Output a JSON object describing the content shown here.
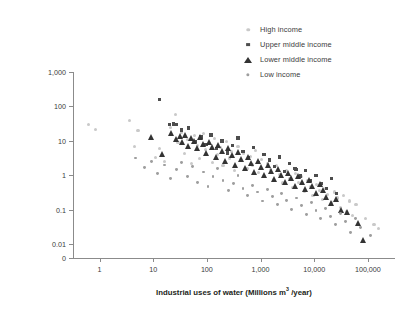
{
  "chart_data": {
    "type": "scatter",
    "title": "",
    "xlabel": "Industrial uses of water (Millions m³ /year)",
    "ylabel_line1": "Per capita industrial water use efficiency",
    "ylabel_line2": "(US$/m³)",
    "xscale": "log",
    "yscale": "log",
    "xlim": [
      0.32,
      320000
    ],
    "ylim": [
      0.004,
      1000
    ],
    "grid": false,
    "legend_position": "top-right",
    "xticks": [
      "1",
      "10",
      "100",
      "1,000",
      "10,000",
      "100,000"
    ],
    "xtick_values": [
      1,
      10,
      100,
      1000,
      10000,
      100000
    ],
    "yticks": [
      "1,000",
      "100",
      "10",
      "1",
      "0.1",
      "0.01",
      "0"
    ],
    "ytick_values": [
      1000,
      100,
      10,
      1,
      0.1,
      0.01,
      0
    ],
    "series": [
      {
        "name": "High income",
        "marker": "circle",
        "color": "#c9c9c9",
        "size": 3.1,
        "points": [
          [
            0.62,
            30
          ],
          [
            0.85,
            22
          ],
          [
            3.6,
            40
          ],
          [
            4.4,
            7.0
          ],
          [
            5.2,
            20
          ],
          [
            9.0,
            12
          ],
          [
            11,
            3.4
          ],
          [
            13,
            6.0
          ],
          [
            16,
            2.6
          ],
          [
            21,
            25
          ],
          [
            26,
            60
          ],
          [
            29,
            9.0
          ],
          [
            33,
            18
          ],
          [
            38,
            4.2
          ],
          [
            44,
            11
          ],
          [
            52,
            2.2
          ],
          [
            58,
            14
          ],
          [
            66,
            7.5
          ],
          [
            74,
            3.0
          ],
          [
            86,
            16
          ],
          [
            95,
            5.5
          ],
          [
            110,
            8.5
          ],
          [
            125,
            2.4
          ],
          [
            140,
            12
          ],
          [
            160,
            4.0
          ],
          [
            180,
            6.5
          ],
          [
            200,
            1.9
          ],
          [
            230,
            9.5
          ],
          [
            260,
            3.2
          ],
          [
            290,
            5.0
          ],
          [
            330,
            1.4
          ],
          [
            380,
            7.0
          ],
          [
            430,
            2.8
          ],
          [
            490,
            4.4
          ],
          [
            560,
            1.6
          ],
          [
            640,
            3.6
          ],
          [
            720,
            2.0
          ],
          [
            820,
            5.2
          ],
          [
            930,
            1.2
          ],
          [
            1050,
            2.9
          ],
          [
            1200,
            0.9
          ],
          [
            1350,
            2.2
          ],
          [
            1550,
            1.5
          ],
          [
            1750,
            0.75
          ],
          [
            2000,
            1.9
          ],
          [
            2300,
            1.05
          ],
          [
            2600,
            0.6
          ],
          [
            3000,
            1.4
          ],
          [
            3400,
            0.8
          ],
          [
            3900,
            0.45
          ],
          [
            4400,
            1.1
          ],
          [
            5000,
            0.62
          ],
          [
            5700,
            0.9
          ],
          [
            6500,
            0.34
          ],
          [
            7400,
            0.7
          ],
          [
            8400,
            0.48
          ],
          [
            9500,
            0.26
          ],
          [
            11000,
            0.55
          ],
          [
            12500,
            0.36
          ],
          [
            14000,
            0.2
          ],
          [
            16000,
            0.42
          ],
          [
            18000,
            0.28
          ],
          [
            21000,
            0.16
          ],
          [
            24000,
            0.33
          ],
          [
            27000,
            0.22
          ],
          [
            31000,
            0.12
          ],
          [
            35000,
            0.26
          ],
          [
            40000,
            0.09
          ],
          [
            46000,
            0.18
          ],
          [
            52000,
            0.07
          ],
          [
            60000,
            0.14
          ],
          [
            90000,
            0.055
          ],
          [
            130000,
            0.038
          ],
          [
            160000,
            0.028
          ]
        ]
      },
      {
        "name": "Upper middle income",
        "marker": "square",
        "color": "#4d4d4d",
        "size": 3.4,
        "points": [
          [
            13,
            160
          ],
          [
            20,
            30
          ],
          [
            24,
            31
          ],
          [
            27,
            30
          ],
          [
            34,
            21
          ],
          [
            46,
            24
          ],
          [
            60,
            9.5
          ],
          [
            78,
            13
          ],
          [
            96,
            8.0
          ],
          [
            120,
            15
          ],
          [
            150,
            6.0
          ],
          [
            190,
            10
          ],
          [
            240,
            4.5
          ],
          [
            300,
            7.5
          ],
          [
            380,
            12
          ],
          [
            470,
            5.0
          ],
          [
            590,
            3.2
          ],
          [
            740,
            6.5
          ],
          [
            920,
            2.4
          ],
          [
            1150,
            4.0
          ],
          [
            1450,
            2.8
          ],
          [
            1800,
            1.8
          ],
          [
            2250,
            3.4
          ],
          [
            2800,
            1.3
          ],
          [
            3500,
            2.2
          ],
          [
            4400,
            1.6
          ],
          [
            4600,
            1.5
          ],
          [
            5500,
            0.95
          ],
          [
            6900,
            1.4
          ],
          [
            8600,
            0.7
          ],
          [
            10800,
            1.0
          ],
          [
            13500,
            0.58
          ],
          [
            17000,
            0.42
          ],
          [
            21000,
            0.8
          ],
          [
            26000,
            0.3
          ]
        ]
      },
      {
        "name": "Lower middle income",
        "marker": "triangle",
        "color": "#333333",
        "size": 3.8,
        "points": [
          [
            9.5,
            13
          ],
          [
            15,
            4.0
          ],
          [
            22,
            17
          ],
          [
            28,
            11
          ],
          [
            32,
            14
          ],
          [
            36,
            9.0
          ],
          [
            41,
            15
          ],
          [
            47,
            7.0
          ],
          [
            53,
            12
          ],
          [
            60,
            10
          ],
          [
            68,
            6.0
          ],
          [
            78,
            13
          ],
          [
            88,
            8.0
          ],
          [
            100,
            4.5
          ],
          [
            115,
            9.5
          ],
          [
            130,
            6.5
          ],
          [
            150,
            3.4
          ],
          [
            170,
            7.5
          ],
          [
            195,
            5.0
          ],
          [
            225,
            2.6
          ],
          [
            260,
            6.0
          ],
          [
            300,
            3.8
          ],
          [
            340,
            2.0
          ],
          [
            390,
            4.6
          ],
          [
            450,
            2.9
          ],
          [
            520,
            1.6
          ],
          [
            600,
            3.4
          ],
          [
            690,
            2.2
          ],
          [
            790,
            1.25
          ],
          [
            910,
            2.6
          ],
          [
            1050,
            1.7
          ],
          [
            1200,
            1.0
          ],
          [
            1400,
            2.0
          ],
          [
            1600,
            1.35
          ],
          [
            1850,
            0.8
          ],
          [
            2150,
            1.55
          ],
          [
            2500,
            1.05
          ],
          [
            2900,
            0.62
          ],
          [
            3350,
            1.2
          ],
          [
            3900,
            0.82
          ],
          [
            4500,
            0.5
          ],
          [
            5200,
            0.95
          ],
          [
            6000,
            0.65
          ],
          [
            7000,
            0.4
          ],
          [
            8100,
            0.72
          ],
          [
            9400,
            0.5
          ],
          [
            11000,
            0.31
          ],
          [
            13000,
            0.56
          ],
          [
            15000,
            0.38
          ],
          [
            17500,
            0.24
          ],
          [
            21000,
            0.16
          ],
          [
            26000,
            0.2
          ],
          [
            33000,
            0.1
          ],
          [
            42000,
            0.085
          ],
          [
            68000,
            0.042
          ],
          [
            85000,
            0.013
          ]
        ]
      },
      {
        "name": "Low income",
        "marker": "circle",
        "color": "#9e9e9e",
        "size": 2.9,
        "points": [
          [
            4.6,
            3.2
          ],
          [
            6.8,
            1.7
          ],
          [
            9.2,
            2.6
          ],
          [
            12,
            1.1
          ],
          [
            16,
            2.0
          ],
          [
            21,
            0.8
          ],
          [
            27,
            1.5
          ],
          [
            34,
            2.3
          ],
          [
            43,
            0.95
          ],
          [
            54,
            1.8
          ],
          [
            68,
            0.62
          ],
          [
            85,
            1.25
          ],
          [
            105,
            0.48
          ],
          [
            130,
            0.9
          ],
          [
            160,
            1.6
          ],
          [
            200,
            0.7
          ],
          [
            250,
            0.36
          ],
          [
            310,
            0.58
          ],
          [
            380,
            1.0
          ],
          [
            470,
            0.42
          ],
          [
            580,
            0.26
          ],
          [
            720,
            0.5
          ],
          [
            890,
            0.33
          ],
          [
            1100,
            0.18
          ],
          [
            1350,
            0.4
          ],
          [
            1650,
            0.24
          ],
          [
            2050,
            0.14
          ],
          [
            2500,
            0.3
          ],
          [
            3100,
            0.19
          ],
          [
            3800,
            0.1
          ],
          [
            4700,
            0.22
          ],
          [
            5800,
            0.13
          ],
          [
            7100,
            0.075
          ],
          [
            8800,
            0.16
          ],
          [
            10800,
            0.095
          ],
          [
            13300,
            0.055
          ],
          [
            16400,
            0.11
          ],
          [
            20000,
            0.065
          ],
          [
            25000,
            0.038
          ],
          [
            31000,
            0.08
          ],
          [
            38000,
            0.045
          ],
          [
            47000,
            0.022
          ],
          [
            58000,
            0.055
          ],
          [
            72000,
            0.03
          ],
          [
            110000,
            0.018
          ]
        ]
      }
    ]
  },
  "legend": {
    "items": [
      {
        "label": "High income"
      },
      {
        "label": "Upper middle income"
      },
      {
        "label": "Lower middle income"
      },
      {
        "label": "Low income"
      }
    ]
  }
}
